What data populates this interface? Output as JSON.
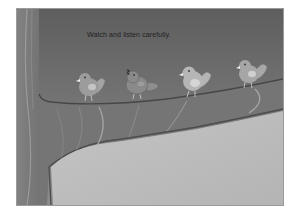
{
  "slide": {
    "instruction": "Watch and listen carefully.",
    "scene_description": "Four cartoon birds perched on a tree branch; trunk on the left, grey sky background",
    "colors": {
      "sky_top": "#5e5e5e",
      "sky_bottom": "#8a8a8a",
      "trunk": "#7a7a7a",
      "branch": "#767676",
      "branch_outline": "#4a4a4a",
      "ground": "#bdbdbd",
      "bird_body": "#9a9a9a",
      "bird_light": "#c8c8c8",
      "bird_beak": "#ececec"
    },
    "birds": [
      {
        "name": "bird-1",
        "state": "perched"
      },
      {
        "name": "bird-2",
        "state": "singing"
      },
      {
        "name": "bird-3",
        "state": "perched"
      },
      {
        "name": "bird-4",
        "state": "perched"
      }
    ]
  }
}
